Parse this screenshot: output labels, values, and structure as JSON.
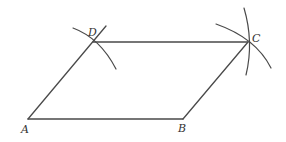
{
  "diagram": {
    "type": "geometric-construction",
    "shape": "parallelogram",
    "points": {
      "A": {
        "label": "A",
        "x": 28,
        "y": 119
      },
      "B": {
        "label": "B",
        "x": 183,
        "y": 119
      },
      "C": {
        "label": "C",
        "x": 248,
        "y": 42
      },
      "D": {
        "label": "D",
        "x": 93,
        "y": 42
      }
    },
    "segments": [
      "AB",
      "BC",
      "CD",
      "DA"
    ],
    "construction_arcs": [
      "arc through D",
      "two arcs intersecting at C"
    ],
    "colors": {
      "stroke": "#4a4a4a",
      "label": "#333333",
      "background": "#ffffff"
    }
  }
}
